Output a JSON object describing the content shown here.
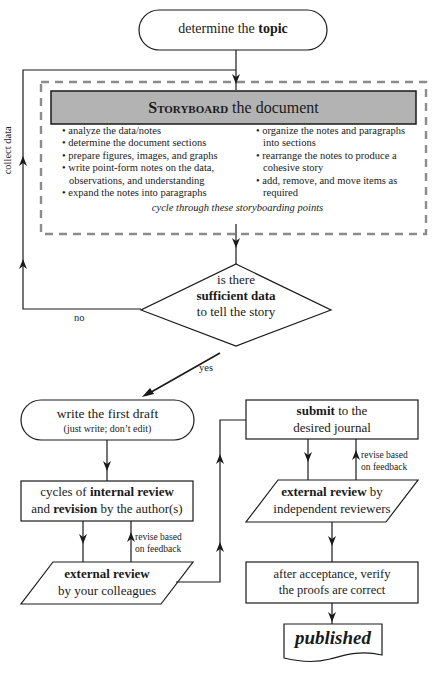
{
  "start": {
    "pre": "determine the ",
    "bold": "topic"
  },
  "storyboard": {
    "title_bold": "Storyboard",
    "title_rest": " the document",
    "left_items": [
      "analyze the data/notes",
      "determine the document sections",
      "prepare figures, images, and graphs",
      "write point-form notes on the data,",
      "observations, and understanding",
      "expand the notes into paragraphs"
    ],
    "right_items": [
      "organize the notes and paragraphs",
      "into sections",
      "rearrange the notes to produce a",
      "cohesive story",
      "add, remove, and move items as",
      "required"
    ],
    "bullet": "•",
    "cycle_note": "cycle through these storyboarding points",
    "fill_color": "#b3b3b3",
    "dash_color": "#8c8c8c"
  },
  "loop_label": "collect data",
  "decision": {
    "line1": "is there",
    "line2_bold": "sufficient data",
    "line3": "to tell the story",
    "no_label": "no",
    "yes_label": "yes"
  },
  "first_draft": {
    "title": "write the first draft",
    "subtitle": "(just write; don’t edit)"
  },
  "internal_review": {
    "l1_pre": "cycles of ",
    "l1_bold": "internal review",
    "l2_pre": "and ",
    "l2_bold": "revision",
    "l2_post": " by the author(s)"
  },
  "revise_label_1": [
    "revise based",
    "on feedback"
  ],
  "colleague_review": {
    "bold": "external review",
    "rest": "by your colleagues"
  },
  "submit": {
    "bold": "submit",
    "rest1": " to the",
    "rest2": "desired journal"
  },
  "revise_label_2": [
    "revise based",
    "on feedback"
  ],
  "independent_review": {
    "bold": "external review",
    "rest1": " by",
    "rest2": "independent reviewers"
  },
  "acceptance": {
    "line1": "after acceptance, verify",
    "line2": "the proofs are correct"
  },
  "end": {
    "label": "published"
  }
}
